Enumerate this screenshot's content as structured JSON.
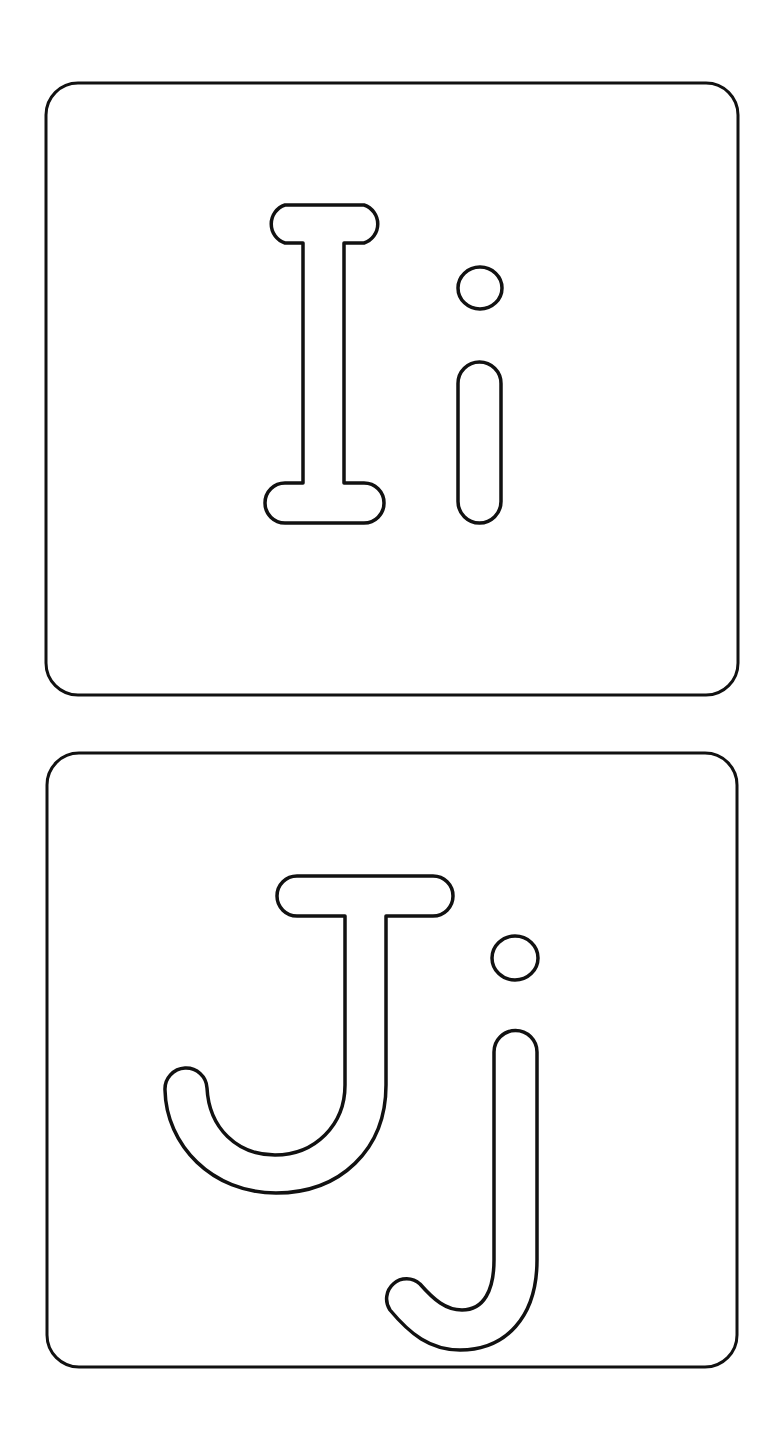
{
  "page": {
    "background": "#ffffff",
    "stroke_color": "#111111"
  },
  "cards": [
    {
      "uppercase": "I",
      "lowercase": "i",
      "label": "I i"
    },
    {
      "uppercase": "J",
      "lowercase": "j",
      "label": "J j"
    }
  ]
}
